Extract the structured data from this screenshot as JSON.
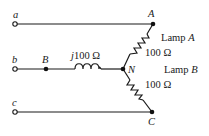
{
  "diagram": {
    "type": "circuit-schematic",
    "terminals": [
      {
        "id": "a",
        "label": "a"
      },
      {
        "id": "b",
        "label": "b"
      },
      {
        "id": "c",
        "label": "c"
      }
    ],
    "nodes": [
      {
        "id": "A",
        "label": "A"
      },
      {
        "id": "B",
        "label": "B"
      },
      {
        "id": "N",
        "label": "N"
      },
      {
        "id": "C",
        "label": "C"
      }
    ],
    "components": {
      "inductor": {
        "prefix": "j",
        "value": "100 Ω",
        "label": "j100 Ω",
        "between": [
          "B",
          "N"
        ]
      },
      "lamp_a": {
        "name_prefix": "Lamp ",
        "name_letter": "A",
        "value": "100 Ω",
        "between": [
          "A",
          "N"
        ]
      },
      "lamp_b": {
        "name_prefix": "Lamp ",
        "name_letter": "B",
        "value": "100 Ω",
        "between": [
          "N",
          "C"
        ]
      }
    },
    "colors": {
      "line": "#1a1a1a",
      "background": "#ffffff"
    }
  }
}
